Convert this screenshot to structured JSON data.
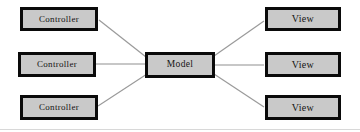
{
  "diagram": {
    "type": "node-link",
    "canvas": {
      "width": 360,
      "height": 132,
      "background": "#ffffff"
    },
    "node_style": {
      "fill": "#c9c9c9",
      "border": "#0a0a0a",
      "text": "#141414"
    },
    "edge_style": {
      "stroke": "#9a9a9a"
    },
    "nodes": [
      {
        "id": "controller1",
        "label": "Controller",
        "role": "controller",
        "x": 20,
        "y": 7,
        "w": 78,
        "h": 24
      },
      {
        "id": "controller2",
        "label": "Controller",
        "role": "controller",
        "x": 18,
        "y": 52,
        "w": 78,
        "h": 25
      },
      {
        "id": "controller3",
        "label": "Controller",
        "role": "controller",
        "x": 20,
        "y": 95,
        "w": 78,
        "h": 25
      },
      {
        "id": "model",
        "label": "Model",
        "role": "model",
        "x": 145,
        "y": 52,
        "w": 70,
        "h": 26
      },
      {
        "id": "view1",
        "label": "View",
        "role": "view",
        "x": 265,
        "y": 7,
        "w": 76,
        "h": 24
      },
      {
        "id": "view2",
        "label": "View",
        "role": "view",
        "x": 265,
        "y": 52,
        "w": 76,
        "h": 25
      },
      {
        "id": "view3",
        "label": "View",
        "role": "view",
        "x": 265,
        "y": 95,
        "w": 76,
        "h": 25
      }
    ],
    "edges": [
      {
        "id": "edge-controller1-model",
        "from": "controller1",
        "to": "model",
        "x1": 99,
        "y1": 20,
        "x2": 146,
        "y2": 57
      },
      {
        "id": "edge-controller2-model",
        "from": "controller2",
        "to": "model",
        "x1": 96,
        "y1": 64,
        "x2": 146,
        "y2": 64
      },
      {
        "id": "edge-controller3-model",
        "from": "controller3",
        "to": "model",
        "x1": 98,
        "y1": 106,
        "x2": 147,
        "y2": 74
      },
      {
        "id": "edge-model-view1",
        "from": "model",
        "to": "view1",
        "x1": 214,
        "y1": 56,
        "x2": 264,
        "y2": 21
      },
      {
        "id": "edge-model-view2",
        "from": "model",
        "to": "view2",
        "x1": 215,
        "y1": 65,
        "x2": 264,
        "y2": 65
      },
      {
        "id": "edge-model-view3",
        "from": "model",
        "to": "view3",
        "x1": 214,
        "y1": 74,
        "x2": 264,
        "y2": 107
      }
    ]
  }
}
